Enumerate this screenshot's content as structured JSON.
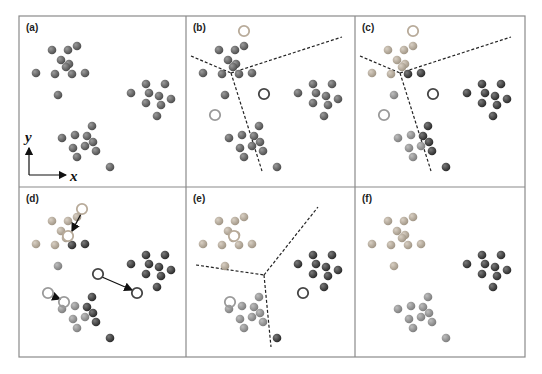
{
  "figure": {
    "frame": {
      "x": 19,
      "y": 16,
      "width": 506,
      "height": 341,
      "border_color": "#8a8a8a"
    },
    "grid": {
      "cols": [
        19,
        186,
        355,
        525
      ],
      "rows": [
        16,
        187,
        357
      ]
    },
    "colors": {
      "unassigned": "#5e5e5e",
      "cluster_light": "#b3a898",
      "cluster_medium": "#8c8c8c",
      "cluster_dark": "#3a3a3a",
      "centroid_light": "#b8ab9a",
      "centroid_medium": "#9a9a9a",
      "centroid_dark": "#444444",
      "boundary": "#222222",
      "arrow": "#111111"
    },
    "axes": {
      "x_label": "x",
      "y_label": "y"
    },
    "points": [
      [
        33,
        34
      ],
      [
        49,
        34
      ],
      [
        58,
        30
      ],
      [
        42,
        44
      ],
      [
        50,
        48
      ],
      [
        47,
        51
      ],
      [
        36,
        58
      ],
      [
        53,
        58
      ],
      [
        66,
        57
      ],
      [
        17,
        57
      ],
      [
        39,
        79
      ],
      [
        127,
        68
      ],
      [
        146,
        68
      ],
      [
        112,
        77
      ],
      [
        130,
        77
      ],
      [
        140,
        80
      ],
      [
        152,
        83
      ],
      [
        127,
        87
      ],
      [
        142,
        89
      ],
      [
        138,
        100
      ],
      [
        73,
        110
      ],
      [
        43,
        122
      ],
      [
        56,
        119
      ],
      [
        68,
        120
      ],
      [
        74,
        126
      ],
      [
        66,
        130
      ],
      [
        54,
        132
      ],
      [
        77,
        135
      ],
      [
        58,
        141
      ],
      [
        91,
        151
      ]
    ],
    "panels": [
      {
        "label": "(a)",
        "step": "data",
        "assign": null,
        "centroids": [],
        "boundaries": [],
        "arrows": [],
        "show_axes": true
      },
      {
        "label": "(b)",
        "step": "initial-centroids",
        "assign": null,
        "centroids": [
          {
            "x": 58,
            "y": 15,
            "color": "centroid_light"
          },
          {
            "x": 78,
            "y": 78,
            "color": "centroid_dark"
          },
          {
            "x": 29,
            "y": 99,
            "color": "centroid_medium"
          }
        ],
        "boundaries": [
          [
            [
              5,
              40
            ],
            [
              45,
              57
            ]
          ],
          [
            [
              45,
              57
            ],
            [
              156,
              21
            ]
          ],
          [
            [
              45,
              57
            ],
            [
              76,
              155
            ]
          ]
        ],
        "arrows": [],
        "show_axes": false
      },
      {
        "label": "(c)",
        "step": "assignment",
        "assign": [
          "L",
          "L",
          "L",
          "L",
          "L",
          "L",
          "L",
          "D",
          "D",
          "L",
          "M",
          "D",
          "D",
          "D",
          "D",
          "D",
          "D",
          "D",
          "D",
          "D",
          "D",
          "M",
          "M",
          "D",
          "D",
          "M",
          "M",
          "D",
          "M",
          "D"
        ],
        "centroids": [
          {
            "x": 58,
            "y": 15,
            "color": "centroid_light"
          },
          {
            "x": 78,
            "y": 78,
            "color": "centroid_dark"
          },
          {
            "x": 29,
            "y": 99,
            "color": "centroid_medium"
          }
        ],
        "boundaries": [
          [
            [
              5,
              40
            ],
            [
              45,
              57
            ]
          ],
          [
            [
              45,
              57
            ],
            [
              156,
              21
            ]
          ],
          [
            [
              45,
              57
            ],
            [
              76,
              155
            ]
          ]
        ],
        "arrows": [],
        "show_axes": false
      },
      {
        "label": "(d)",
        "step": "update-centroids",
        "assign": [
          "L",
          "L",
          "L",
          "L",
          "L",
          "L",
          "L",
          "D",
          "D",
          "L",
          "M",
          "D",
          "D",
          "D",
          "D",
          "D",
          "D",
          "D",
          "D",
          "D",
          "D",
          "M",
          "M",
          "D",
          "D",
          "M",
          "M",
          "D",
          "M",
          "D"
        ],
        "centroids": [
          {
            "x": 63,
            "y": 22,
            "color": "centroid_light",
            "hollow_fill": "#ffffff"
          },
          {
            "x": 49,
            "y": 49,
            "color": "centroid_light",
            "hollow_fill": "#ffffff"
          },
          {
            "x": 79,
            "y": 87,
            "color": "centroid_dark"
          },
          {
            "x": 118,
            "y": 106,
            "color": "centroid_dark"
          },
          {
            "x": 29,
            "y": 106,
            "color": "centroid_medium"
          },
          {
            "x": 45,
            "y": 115,
            "color": "centroid_medium"
          }
        ],
        "boundaries": [],
        "arrows": [
          [
            [
              62,
              27
            ],
            [
              53,
              44
            ]
          ],
          [
            [
              83,
              90
            ],
            [
              113,
              103
            ]
          ],
          [
            [
              33,
              109
            ],
            [
              41,
              112
            ]
          ]
        ],
        "show_axes": false
      },
      {
        "label": "(e)",
        "step": "new-boundaries",
        "assign": [
          "L",
          "L",
          "L",
          "L",
          "L",
          "L",
          "L",
          "L",
          "L",
          "L",
          "L",
          "D",
          "D",
          "D",
          "D",
          "D",
          "D",
          "D",
          "D",
          "D",
          "M",
          "M",
          "M",
          "M",
          "M",
          "M",
          "M",
          "M",
          "M",
          "D"
        ],
        "centroids": [
          {
            "x": 48,
            "y": 49,
            "color": "centroid_light",
            "hollow_fill": "#ffffff"
          },
          {
            "x": 117,
            "y": 106,
            "color": "centroid_dark"
          },
          {
            "x": 44,
            "y": 115,
            "color": "centroid_medium"
          }
        ],
        "boundaries": [
          [
            [
              10,
              78
            ],
            [
              78,
              88
            ]
          ],
          [
            [
              78,
              88
            ],
            [
              132,
              20
            ]
          ],
          [
            [
              78,
              88
            ],
            [
              85,
              160
            ]
          ]
        ],
        "arrows": [],
        "show_axes": false
      },
      {
        "label": "(f)",
        "step": "converged",
        "assign": [
          "L",
          "L",
          "L",
          "L",
          "L",
          "L",
          "L",
          "L",
          "L",
          "L",
          "L",
          "D",
          "D",
          "D",
          "D",
          "D",
          "D",
          "D",
          "D",
          "D",
          "M",
          "M",
          "M",
          "M",
          "M",
          "M",
          "M",
          "M",
          "M",
          "M"
        ],
        "centroids": [],
        "boundaries": [],
        "arrows": [],
        "show_axes": false
      }
    ]
  }
}
